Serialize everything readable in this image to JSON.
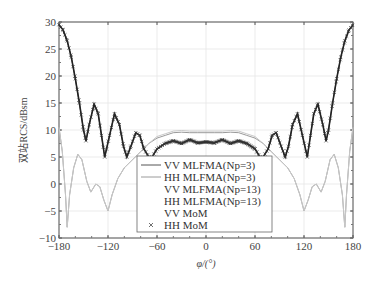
{
  "chart_data": {
    "type": "line",
    "title": "",
    "xlabel": "φ/(°)",
    "ylabel": "双站RCS/dBsm",
    "xlim": [
      -180,
      180
    ],
    "ylim": [
      -10,
      30
    ],
    "xticks": [
      -180,
      -120,
      -60,
      0,
      60,
      120,
      180
    ],
    "yticks": [
      -10,
      -5,
      0,
      5,
      10,
      15,
      20,
      25,
      30
    ],
    "xtick_labels": [
      "−180",
      "−120",
      "−60",
      "0",
      "60",
      "120",
      "180"
    ],
    "ytick_labels": [
      "−10",
      "−5",
      "0",
      "5",
      "10",
      "15",
      "20",
      "25",
      "30"
    ],
    "grid": true,
    "legend_position": "lower center",
    "legend": [
      "VV MLFMA(Np=3)",
      "HH MLFMA(Np=3)",
      "VV MLFMA(Np=13)",
      "HH MLFMA(Np=13)",
      "VV MoM",
      "HH MoM"
    ],
    "series": [
      {
        "name": "VV (MLFMA / MoM)",
        "color": "#222222",
        "x": [
          -180,
          -175,
          -170,
          -165,
          -160,
          -155,
          -150,
          -147,
          -143,
          -137,
          -132,
          -128,
          -124,
          -118,
          -112,
          -106,
          -101,
          -97,
          -92,
          -86,
          -81,
          -76,
          -70,
          -66,
          -60,
          -50,
          -40,
          -30,
          -20,
          -10,
          0,
          10,
          20,
          30,
          40,
          50,
          60,
          66,
          70,
          76,
          81,
          86,
          92,
          97,
          101,
          106,
          112,
          118,
          124,
          128,
          132,
          137,
          143,
          147,
          150,
          155,
          160,
          165,
          170,
          175,
          180
        ],
        "values": [
          29.5,
          28.5,
          26.5,
          23.5,
          19.5,
          15,
          10,
          8,
          11,
          14.8,
          13,
          9,
          5,
          9,
          13,
          11,
          7,
          5,
          7,
          9.5,
          9,
          6.5,
          5,
          5,
          6.5,
          7.5,
          8,
          7.5,
          8.2,
          7.6,
          7.8,
          7.6,
          8.2,
          7.5,
          8,
          7.5,
          6.5,
          5,
          5,
          6.5,
          9,
          9.5,
          7,
          5,
          7,
          11,
          13,
          9,
          5,
          9,
          13,
          14.8,
          11,
          8,
          10,
          15,
          19.5,
          23.5,
          26.5,
          28.5,
          29.5
        ]
      },
      {
        "name": "HH (MLFMA / MoM)",
        "color": "#8a8a8a",
        "x": [
          -180,
          -176,
          -172,
          -170,
          -167,
          -162,
          -157,
          -152,
          -146,
          -141,
          -135,
          -130,
          -125,
          -120,
          -115,
          -108,
          -100,
          -90,
          -80,
          -70,
          -60,
          -50,
          -40,
          -30,
          -20,
          -10,
          0,
          10,
          20,
          30,
          40,
          50,
          60,
          70,
          80,
          90,
          100,
          108,
          115,
          120,
          125,
          130,
          135,
          141,
          146,
          152,
          157,
          162,
          167,
          170,
          172,
          176,
          180
        ],
        "values": [
          10.5,
          6,
          -2,
          -8,
          -2,
          3,
          5.5,
          4.5,
          0.5,
          -1.5,
          0,
          -0.5,
          -3,
          -5,
          -2,
          1,
          3,
          4.5,
          6,
          7.5,
          8.5,
          9,
          9.5,
          9.6,
          9.5,
          9.5,
          9.5,
          9.5,
          9.5,
          9.6,
          9.5,
          9,
          8.5,
          7.5,
          6,
          4.5,
          3,
          1,
          -2,
          -5,
          -3,
          -0.5,
          0,
          -1.5,
          0.5,
          4.5,
          5.5,
          3,
          -2,
          -8,
          -2,
          6,
          10.5
        ]
      }
    ]
  }
}
